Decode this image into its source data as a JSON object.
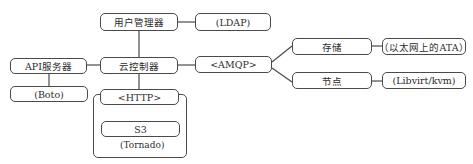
{
  "diagram": {
    "nodes": {
      "user_manager": "用户管理器",
      "ldap": "(LDAP)",
      "cloud_controller": "云控制器",
      "amqp": "<AMQP>",
      "api_server": "API服务器",
      "boto": "(Boto)",
      "http": "<HTTP>",
      "s3": "S3",
      "tornado": "(Tornado)",
      "storage": "存储",
      "ata_over_ethernet": "（以太网上的ATA）",
      "compute_node": "节点",
      "libvirt_kvm": "(Libvirt/kvm)"
    },
    "edges": [
      [
        "user_manager",
        "ldap"
      ],
      [
        "user_manager",
        "cloud_controller"
      ],
      [
        "cloud_controller",
        "amqp"
      ],
      [
        "api_server",
        "cloud_controller"
      ],
      [
        "api_server",
        "boto"
      ],
      [
        "cloud_controller",
        "http"
      ],
      [
        "amqp",
        "storage"
      ],
      [
        "amqp",
        "compute_node"
      ],
      [
        "storage",
        "ata_over_ethernet"
      ],
      [
        "compute_node",
        "libvirt_kvm"
      ]
    ]
  }
}
